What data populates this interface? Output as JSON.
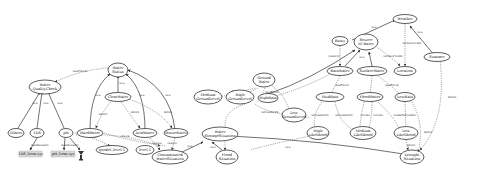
{
  "diagram": {
    "type": "knowledge-graph",
    "nodes": {
      "weather": "Weather",
      "rainy": "Rainy",
      "source_of_water": [
        "Source",
        "of Water"
      ],
      "location": "Location",
      "summer": "Summer",
      "ground_water": [
        "Ground",
        "Water"
      ],
      "rain_water": "RainWater",
      "surface_water": "SurfaceWater",
      "water_status": [
        "Water",
        "Status"
      ],
      "water_quality_check": [
        "Water",
        "QualityCheck"
      ],
      "clear_water": "ClearWater",
      "mud_rain": "MudRain",
      "flood_water": "FloodWater",
      "low_rain": "LowRain",
      "medium_ground_level": [
        "Medium",
        "GroundLevel"
      ],
      "high_ground_level": [
        "High",
        "GroundLevel"
      ],
      "high_rain": "HighRain",
      "low_ground_level": [
        "Low",
        "GroundLevel"
      ],
      "high_likelihood": [
        "High",
        "Likelihood"
      ],
      "medium_likelihood": [
        "Medium",
        "Likelihood"
      ],
      "low_likelihood": [
        "Low",
        "Likelihood"
      ],
      "drought_situation": [
        "Drought",
        "Situation"
      ],
      "water_storage_situation": [
        "Water",
        "StorageSituation"
      ],
      "flood_situation": [
        "Flood",
        "Situation"
      ],
      "others": "Others",
      "tds": "TDS",
      "ph": "pH",
      "hard_water": "HardWater",
      "acid_water": "AcidWater",
      "waste_water": "WasteWater",
      "contaminated_water_situation": [
        "Contaminated",
        "WaterSituation"
      ],
      "good_level": "goodel_level.1",
      "level": "level.1",
      "tds_box": "TDS_from.sys",
      "ph_box": "pH_from.sys"
    },
    "edge_labels": {
      "is_a": "is-a",
      "leads_to": "leads-to",
      "has_check": "hasCheck",
      "observed_in": "isObservedIn",
      "has_level": "hasLevel",
      "has_flood": "hasFlood",
      "infers": "infers",
      "is_possible_to": "isPossibleTo",
      "level_is": "levelIs",
      "has_measure": "hasMeasure",
      "causes": "causes",
      "check": "check",
      "has_sensor": "hasSensor",
      "leads_to_possible": "leadsToPossible",
      "is_observed_in_2": "isObservedIn"
    },
    "icons": {
      "sensor": "sensor-antenna-icon"
    }
  }
}
